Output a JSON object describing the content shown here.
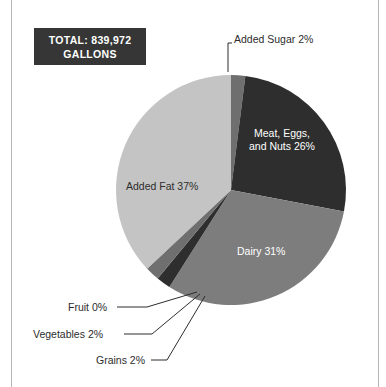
{
  "badge": {
    "line1": "TOTAL: 839,972",
    "line2": "GALLONS"
  },
  "labels": {
    "added_sugar": "Added Sugar 2%",
    "meat_line1": "Meat, Eggs,",
    "meat_line2": "and Nuts 26%",
    "dairy": "Dairy 31%",
    "added_fat": "Added Fat 37%",
    "fruit": "Fruit 0%",
    "vegetables": "Vegetables 2%",
    "grains": "Grains 2%"
  },
  "colors": {
    "added_sugar": "#6f6f6f",
    "meat_eggs_nuts": "#2e2e2e",
    "dairy": "#7d7d7d",
    "grains": "#2e2e2e",
    "vegetables": "#6f6f6f",
    "fruit": "#9a9a9a",
    "added_fat": "#c4c4c4",
    "badge_background": "#363636",
    "badge_text": "#ffffff",
    "frame": "#b5b5b5",
    "page_background": "#ffffff",
    "label_dark_text": "#2d2d2d",
    "label_light_text": "#ffffff"
  },
  "chart_data": {
    "type": "pie",
    "title": "",
    "total_label": "TOTAL: 839,972 GALLONS",
    "total_value": 839972,
    "units": "gallons",
    "legend": "none",
    "labels_inside_slices": [
      "Meat, Eggs, and Nuts 26%",
      "Dairy 31%",
      "Added Fat 37%"
    ],
    "labels_with_leader_lines": [
      "Added Sugar 2%",
      "Fruit 0%",
      "Vegetables 2%",
      "Grains 2%"
    ],
    "start_angle_deg": 0,
    "direction": "clockwise",
    "categories": [
      "Added Sugar",
      "Meat, Eggs, and Nuts",
      "Dairy",
      "Grains",
      "Vegetables",
      "Fruit",
      "Added Fat"
    ],
    "values": [
      2,
      26,
      31,
      2,
      2,
      0,
      37
    ],
    "slices": [
      {
        "name": "Added Sugar",
        "value": 2,
        "label": "Added Sugar 2%",
        "color": "#6f6f6f"
      },
      {
        "name": "Meat, Eggs, and Nuts",
        "value": 26,
        "label": "Meat, Eggs, and Nuts 26%",
        "color": "#2e2e2e"
      },
      {
        "name": "Dairy",
        "value": 31,
        "label": "Dairy 31%",
        "color": "#7d7d7d"
      },
      {
        "name": "Grains",
        "value": 2,
        "label": "Grains 2%",
        "color": "#2e2e2e"
      },
      {
        "name": "Vegetables",
        "value": 2,
        "label": "Vegetables 2%",
        "color": "#6f6f6f"
      },
      {
        "name": "Fruit",
        "value": 0,
        "label": "Fruit 0%",
        "color": "#9a9a9a"
      },
      {
        "name": "Added Fat",
        "value": 37,
        "label": "Added Fat 37%",
        "color": "#c4c4c4"
      }
    ]
  }
}
